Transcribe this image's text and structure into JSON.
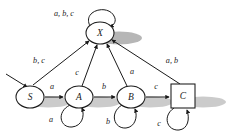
{
  "diagram": {
    "type": "state-machine",
    "alphabet": [
      "a",
      "b",
      "c"
    ],
    "colors": {
      "stroke": "#1a1a1a",
      "fill": "#ffffff",
      "shadow": "#9a9a9a",
      "background": "#ffffff"
    },
    "states": [
      {
        "id": "S",
        "label": "S",
        "shape": "ellipse",
        "kind": "start",
        "cx": 30,
        "cy": 97,
        "rx": 14,
        "ry": 11
      },
      {
        "id": "A",
        "label": "A",
        "shape": "ellipse",
        "kind": "normal",
        "cx": 79,
        "cy": 97,
        "rx": 14,
        "ry": 11
      },
      {
        "id": "B",
        "label": "B",
        "shape": "ellipse",
        "kind": "normal",
        "cx": 131,
        "cy": 97,
        "rx": 14,
        "ry": 11
      },
      {
        "id": "C",
        "label": "C",
        "shape": "square",
        "kind": "accepting",
        "cx": 183,
        "cy": 96,
        "size": 24
      },
      {
        "id": "X",
        "label": "X",
        "shape": "ellipse",
        "kind": "trap",
        "cx": 100,
        "cy": 33,
        "rx": 14,
        "ry": 11
      }
    ],
    "transitions": [
      {
        "from": "start",
        "to": "S",
        "label": ""
      },
      {
        "from": "S",
        "to": "A",
        "label": "a",
        "label_x": 52,
        "label_y": 86
      },
      {
        "from": "A",
        "to": "B",
        "label": "b",
        "label_x": 104,
        "label_y": 86
      },
      {
        "from": "B",
        "to": "C",
        "label": "c",
        "label_x": 156,
        "label_y": 86
      },
      {
        "from": "S",
        "to": "X",
        "label": "b, c",
        "label_x": 39,
        "label_y": 60
      },
      {
        "from": "A",
        "to": "X",
        "label": "c",
        "label_x": 77,
        "label_y": 72
      },
      {
        "from": "B",
        "to": "X",
        "label": "a",
        "label_x": 132,
        "label_y": 71
      },
      {
        "from": "C",
        "to": "X",
        "label": "a, b",
        "label_x": 172,
        "label_y": 60
      },
      {
        "from": "X",
        "to": "X",
        "label": "a, b, c",
        "label_x": 64,
        "label_y": 13,
        "self_loop": true
      },
      {
        "from": "A",
        "to": "A",
        "label": "a",
        "label_x": 51,
        "label_y": 119,
        "self_loop": true
      },
      {
        "from": "B",
        "to": "B",
        "label": "b",
        "label_x": 108,
        "label_y": 121,
        "self_loop": true
      },
      {
        "from": "C",
        "to": "C",
        "label": "c",
        "label_x": 159,
        "label_y": 123,
        "self_loop": true
      }
    ]
  }
}
